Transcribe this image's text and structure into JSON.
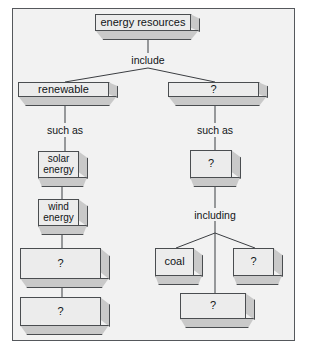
{
  "diagram": {
    "frame_border_color": "#55585c",
    "frame_background": "#f2f2f2",
    "box_face_color": "#ececec",
    "box_shade_color": "#c9c9c9",
    "box_outline_color": "#4a4d50",
    "connector_color": "#3b3e42"
  },
  "nodes": {
    "root": "energy resources",
    "left_branch": "renewable",
    "right_branch": "?",
    "left_child_1": "solar energy",
    "left_child_2": "wind energy",
    "left_child_3": "?",
    "left_child_4": "?",
    "right_child_1": "?",
    "right_leaf_coal": "coal",
    "right_leaf_unknown_1": "?",
    "right_leaf_unknown_2": "?"
  },
  "connectors": {
    "include": "include",
    "such_as_left": "such as",
    "such_as_right": "such as",
    "including": "including"
  }
}
